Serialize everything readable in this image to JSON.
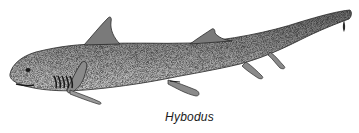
{
  "figure": {
    "style": "stipple drawing",
    "caption": "Hybodus",
    "colors": {
      "ink": "#1a1a1a",
      "shade": "#8c8c8c",
      "background": "#ffffff"
    }
  }
}
